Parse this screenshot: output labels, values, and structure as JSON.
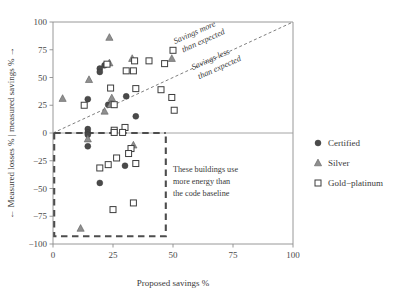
{
  "chart_data": {
    "type": "scatter",
    "title": "",
    "xlabel": "Proposed savings %",
    "ylabel": "← Measured losses % | measured savings % →",
    "xlim": [
      0,
      100
    ],
    "ylim": [
      -100,
      100
    ],
    "xticks": [
      "0",
      "25",
      "50",
      "75",
      "100"
    ],
    "xtick_values": [
      0,
      25,
      50,
      75,
      100
    ],
    "yticks": [
      "100",
      "75",
      "50",
      "25",
      "0",
      "−25",
      "−50",
      "−75",
      "−100"
    ],
    "ytick_values": [
      100,
      75,
      50,
      25,
      0,
      -25,
      -50,
      -75,
      -100
    ],
    "grid": false,
    "legend_position": "right",
    "reference_lines": [
      {
        "name": "parity-line",
        "style": "dashed",
        "from": [
          0,
          0
        ],
        "to": [
          100,
          100
        ]
      },
      {
        "name": "zero-line",
        "style": "solid",
        "from": [
          0,
          0
        ],
        "to": [
          100,
          0
        ]
      }
    ],
    "annotations": [
      {
        "name": "savings-more-label",
        "text": "Savings more\nthan expected",
        "x": 52,
        "y": 72,
        "rotation": -24
      },
      {
        "name": "savings-less-label",
        "text": "Savings less\nthan expected",
        "x": 62,
        "y": 48,
        "rotation": -24
      },
      {
        "name": "underperform-box-label",
        "text": "These buildings use\nmore energy than\nthe code baseline",
        "x": 50,
        "y": -30
      }
    ],
    "highlight_box": {
      "name": "underperforming-region",
      "x0": 0.5,
      "x1": 47,
      "y0": -93,
      "y1": 0,
      "style": "dashed"
    },
    "series": [
      {
        "name": "Certified",
        "marker": "filled-circle",
        "color": "#4a4a4a",
        "points": [
          [
            14.5,
            30.5
          ],
          [
            19.5,
            58.0
          ],
          [
            19.5,
            55.0
          ],
          [
            21.5,
            61.0
          ],
          [
            23.0,
            25.5
          ],
          [
            24.5,
            26.5
          ],
          [
            30.5,
            33.0
          ],
          [
            34.5,
            15.0
          ],
          [
            14.5,
            3.5
          ],
          [
            14.5,
            0.5
          ],
          [
            14.5,
            -1.5
          ],
          [
            14.5,
            -12.0
          ],
          [
            30.0,
            -29.5
          ],
          [
            19.5,
            -45.0
          ]
        ]
      },
      {
        "name": "Silver",
        "marker": "filled-triangle",
        "color": "#8f8f8f",
        "points": [
          [
            23.5,
            86.0
          ],
          [
            33.0,
            67.0
          ],
          [
            49.5,
            67.0
          ],
          [
            23.5,
            63.0
          ],
          [
            15.0,
            48.0
          ],
          [
            4.0,
            31.0
          ],
          [
            24.5,
            31.5
          ],
          [
            24.0,
            25.5
          ],
          [
            21.5,
            19.5
          ],
          [
            14.5,
            -5.5
          ],
          [
            33.5,
            -11.0
          ],
          [
            11.5,
            -86.0
          ]
        ]
      },
      {
        "name": "Gold−platinum",
        "marker": "open-square",
        "color": "#ffffff",
        "points": [
          [
            50.0,
            74.5
          ],
          [
            22.5,
            62.0
          ],
          [
            34.0,
            65.0
          ],
          [
            40.0,
            65.0
          ],
          [
            46.5,
            62.5
          ],
          [
            30.5,
            56.0
          ],
          [
            33.5,
            56.0
          ],
          [
            24.0,
            40.5
          ],
          [
            34.5,
            40.0
          ],
          [
            45.0,
            39.0
          ],
          [
            49.5,
            32.0
          ],
          [
            50.5,
            20.5
          ],
          [
            13.0,
            25.0
          ],
          [
            25.5,
            25.5
          ],
          [
            25.5,
            2.5
          ],
          [
            30.0,
            5.0
          ],
          [
            25.5,
            0.5
          ],
          [
            29.0,
            0.5
          ],
          [
            32.5,
            -14.0
          ],
          [
            31.5,
            -18.5
          ],
          [
            26.5,
            -22.5
          ],
          [
            34.5,
            -27.5
          ],
          [
            23.0,
            -28.5
          ],
          [
            19.5,
            -31.5
          ],
          [
            33.5,
            -63.0
          ],
          [
            25.0,
            -69.0
          ]
        ]
      }
    ]
  },
  "legend": {
    "items": [
      {
        "label": "Certified",
        "marker": "filled-circle"
      },
      {
        "label": "Silver",
        "marker": "filled-triangle"
      },
      {
        "label": "Gold−platinum",
        "marker": "open-square"
      }
    ]
  },
  "colors": {
    "certified": "#4a4a4a",
    "silver": "#8f8f8f",
    "gold_platinum_fill": "#ffffff",
    "gold_platinum_stroke": "#3d3d3d",
    "axis": "#8d8d8d",
    "box": "#4d4d4d",
    "text": "#3a3a3a",
    "background": "#ffffff"
  }
}
